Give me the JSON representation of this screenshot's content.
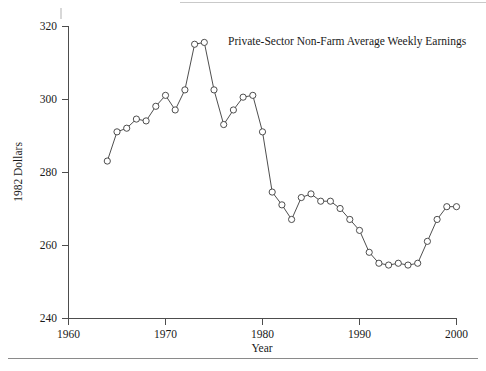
{
  "chart_data": {
    "type": "line",
    "title": "Private-Sector Non-Farm Average Weekly Earnings",
    "xlabel": "Year",
    "ylabel": "1982 Dollars",
    "xlim": [
      1958,
      2001
    ],
    "ylim": [
      236,
      322
    ],
    "xticks": [
      1960,
      1970,
      1980,
      1990,
      2000
    ],
    "xtick_labels": [
      "1960",
      "1970",
      "1980",
      "1990",
      "2000"
    ],
    "yticks": [
      240,
      260,
      280,
      300,
      320
    ],
    "ytick_labels": [
      "240",
      "260",
      "280",
      "300",
      "320"
    ],
    "grid": false,
    "legend": "none",
    "marker": "open-circle",
    "line_color": "#3a3a3a",
    "marker_fill": "#ffffff",
    "x": [
      1964,
      1965,
      1966,
      1967,
      1968,
      1969,
      1970,
      1971,
      1972,
      1973,
      1974,
      1975,
      1976,
      1977,
      1978,
      1979,
      1980,
      1981,
      1982,
      1983,
      1984,
      1985,
      1986,
      1987,
      1988,
      1989,
      1990,
      1991,
      1992,
      1993,
      1994,
      1995,
      1996,
      1997,
      1998,
      1999,
      2000
    ],
    "values": [
      283.0,
      291.0,
      292.0,
      294.5,
      294.0,
      298.0,
      301.0,
      297.0,
      302.5,
      315.0,
      315.5,
      302.5,
      293.0,
      297.0,
      300.5,
      301.0,
      291.0,
      274.5,
      271.0,
      267.0,
      273.0,
      274.0,
      272.0,
      272.0,
      270.0,
      267.0,
      264.0,
      258.0,
      255.0,
      254.5,
      255.0,
      254.5,
      255.0,
      261.0,
      267.0,
      270.5,
      270.5
    ],
    "series": [
      {
        "name": "Private-Sector Non-Farm Average Weekly Earnings",
        "values": [
          283.0,
          291.0,
          292.0,
          294.5,
          294.0,
          298.0,
          301.0,
          297.0,
          302.5,
          315.0,
          315.5,
          302.5,
          293.0,
          297.0,
          300.5,
          301.0,
          291.0,
          274.5,
          271.0,
          267.0,
          273.0,
          274.0,
          272.0,
          272.0,
          270.0,
          267.0,
          264.0,
          258.0,
          255.0,
          254.5,
          255.0,
          254.5,
          255.0,
          261.0,
          267.0,
          270.5,
          270.5
        ]
      }
    ]
  }
}
